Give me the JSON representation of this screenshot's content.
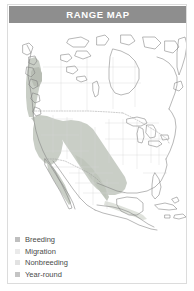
{
  "card": {
    "header": {
      "title": "RANGE MAP",
      "background_color": "#8e8e8e",
      "text_color": "#ffffff"
    },
    "legend": {
      "items": [
        {
          "label": "Breeding",
          "swatch_color": "#bfbfbf"
        },
        {
          "label": "Migration",
          "swatch_color": "#eaeaea"
        },
        {
          "label": "Nonbreeding",
          "swatch_color": "#e2e2e2"
        },
        {
          "label": "Year-round",
          "swatch_color": "#c4c4c4"
        }
      ]
    },
    "map": {
      "region": "North America",
      "outline_color": "#808080",
      "internal_border_color": "#d2d2d2",
      "range_fill_color": "#c9cec6",
      "range_fill_color_light": "#dfe2dc",
      "water_color": "#ffffff",
      "dotted_border_color": "#9a9a9a"
    }
  }
}
